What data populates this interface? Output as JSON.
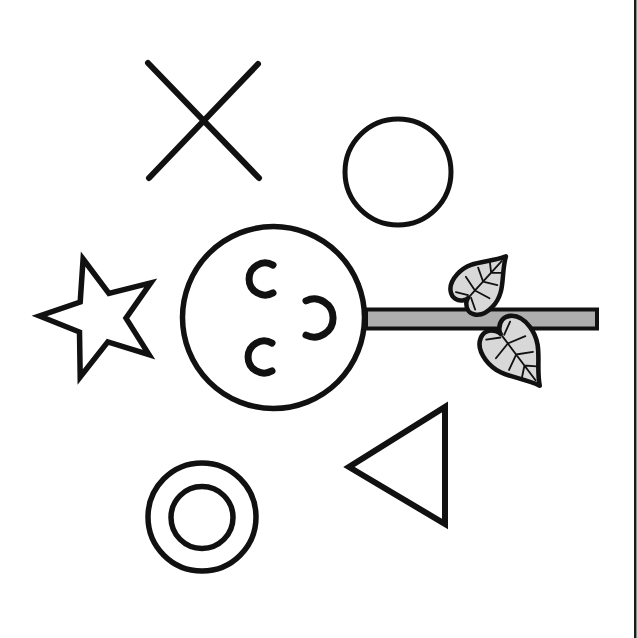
{
  "canvas": {
    "width": 637,
    "height": 638,
    "background_color": "#ffffff"
  },
  "palette": {
    "ink": "#111111",
    "branch_gray": "#aeaeae",
    "leaf_gray": "#d8d8d8",
    "page_edge_dark": "#1c1c1c",
    "paper_white": "#ffffff"
  },
  "illustration": {
    "shapes": [
      {
        "name": "background",
        "type": "rect",
        "attrs": {
          "x": 0,
          "y": 0,
          "width": 637,
          "height": 638,
          "fill": "#ffffff"
        }
      },
      {
        "name": "page-edge-line",
        "type": "rect",
        "attrs": {
          "x": 634,
          "y": 0,
          "width": 2.5,
          "height": 638,
          "fill": "#1c1c1c"
        }
      },
      {
        "name": "x-mark-stroke-backslash",
        "type": "line",
        "attrs": {
          "x1": 148,
          "y1": 63,
          "x2": 259,
          "y2": 178,
          "stroke": "#111111",
          "stroke-width": 6,
          "stroke-linecap": "round"
        }
      },
      {
        "name": "x-mark-stroke-slash",
        "type": "line",
        "attrs": {
          "x1": 258,
          "y1": 64,
          "x2": 149,
          "y2": 178,
          "stroke": "#111111",
          "stroke-width": 6,
          "stroke-linecap": "round"
        }
      },
      {
        "name": "small-circle-shape",
        "type": "circle",
        "attrs": {
          "cx": 398,
          "cy": 172,
          "r": 53,
          "fill": "none",
          "stroke": "#111111",
          "stroke-width": 5
        }
      },
      {
        "name": "star-shape",
        "type": "polygon",
        "attrs": {
          "points": "83.1,259 108.9,293.5 150.7,282.9 126,318.1 149,354.6 107.8,341.9 80.2,377 79.5,332 39.5,316 80.2,302",
          "fill": "#ffffff",
          "stroke": "#111111",
          "stroke-width": 5.5,
          "stroke-linejoin": "miter"
        }
      },
      {
        "name": "branch-bar",
        "type": "rect",
        "attrs": {
          "x": 366,
          "y": 309.5,
          "width": 231,
          "height": 19,
          "fill": "#aeaeae",
          "stroke": "#111111",
          "stroke-width": 4
        }
      },
      {
        "name": "fruit-circle",
        "type": "circle",
        "attrs": {
          "cx": 273.5,
          "cy": 317.5,
          "r": 91,
          "fill": "#ffffff",
          "stroke": "#111111",
          "stroke-width": 5.5
        }
      },
      {
        "name": "fruit-arc-top-left",
        "type": "path",
        "attrs": {
          "d": "M 273,265.1 A 16,16 0 1 0 273,292.9",
          "fill": "none",
          "stroke": "#111111",
          "stroke-width": 7,
          "stroke-linecap": "round"
        }
      },
      {
        "name": "fruit-arc-right",
        "type": "path",
        "attrs": {
          "d": "M 306,335.2 A 19,19 0 1 0 306,300.8",
          "fill": "none",
          "stroke": "#111111",
          "stroke-width": 7,
          "stroke-linecap": "round"
        }
      },
      {
        "name": "fruit-arc-bottom-left",
        "type": "path",
        "attrs": {
          "d": "M 272,343.1 A 16,16 0 1 0 272,370.9",
          "fill": "none",
          "stroke": "#111111",
          "stroke-width": 7,
          "stroke-linecap": "round"
        }
      },
      {
        "name": "leaf-upper-blade",
        "type": "path",
        "attrs": {
          "d": "M 0,40 C -9,22 -24,14 -24,-6 C -24,-24 -10,-31 -2,-21 C -0.5,-19 0,-17.5 0,-16.5 C 0,-17.5 0.5,-19 2,-21 C 10,-31 24,-24 24,-6 C 24,14 9,22 0,40 Z",
          "transform": "translate(479,286) rotate(-137.7)",
          "fill": "#d8d8d8",
          "stroke": "#111111",
          "stroke-width": 4.5,
          "stroke-linejoin": "round"
        }
      },
      {
        "name": "leaf-upper-veins",
        "type": "path",
        "attrs": {
          "d": "M 0,-14 L 0,34 M 0,-6 L -16,-2 M 0,-6 L 16,-2 M 0,6 L -13,13 M 0,6 L 13,13 M 0,18 L -8,25 M 0,18 L 8,25 M -2,-14 L -13,-20 M 2,-14 L 13,-20",
          "transform": "translate(479,286) rotate(-137.7)",
          "fill": "none",
          "stroke": "#111111",
          "stroke-width": 1.8,
          "stroke-linecap": "round"
        }
      },
      {
        "name": "leaf-lower-blade",
        "type": "path",
        "attrs": {
          "d": "M 0,40 C -9,22 -24,14 -24,-6 C -24,-24 -10,-31 -2,-21 C -0.5,-19 0,-17.5 0,-16.5 C 0,-17.5 0.5,-19 2,-21 C 10,-31 24,-24 24,-6 C 24,14 9,22 0,40 Z",
          "transform": "translate(512,349) rotate(-37) scale(1.15)",
          "fill": "#d8d8d8",
          "stroke": "#111111",
          "stroke-width": 4,
          "stroke-linejoin": "round"
        }
      },
      {
        "name": "leaf-lower-veins",
        "type": "path",
        "attrs": {
          "d": "M 0,-14 L 0,34 M 0,-6 L -16,-2 M 0,-6 L 16,-2 M 0,6 L -13,13 M 0,6 L 13,13 M 0,18 L -8,25 M 0,18 L 8,25 M -2,-14 L -13,-20 M 2,-14 L 13,-20",
          "transform": "translate(512,349) rotate(-37) scale(1.15)",
          "fill": "none",
          "stroke": "#111111",
          "stroke-width": 1.6,
          "stroke-linecap": "round"
        }
      },
      {
        "name": "triangle-shape",
        "type": "polygon",
        "attrs": {
          "points": "445,407 445,524 349,467",
          "fill": "#ffffff",
          "stroke": "#111111",
          "stroke-width": 6,
          "stroke-linejoin": "miter"
        }
      },
      {
        "name": "donut-outer-circle",
        "type": "circle",
        "attrs": {
          "cx": 202,
          "cy": 517,
          "r": 54,
          "fill": "#ffffff",
          "stroke": "#111111",
          "stroke-width": 5.5
        }
      },
      {
        "name": "donut-inner-circle",
        "type": "circle",
        "attrs": {
          "cx": 202,
          "cy": 517.5,
          "r": 31,
          "fill": "none",
          "stroke": "#111111",
          "stroke-width": 5.5
        }
      }
    ]
  }
}
